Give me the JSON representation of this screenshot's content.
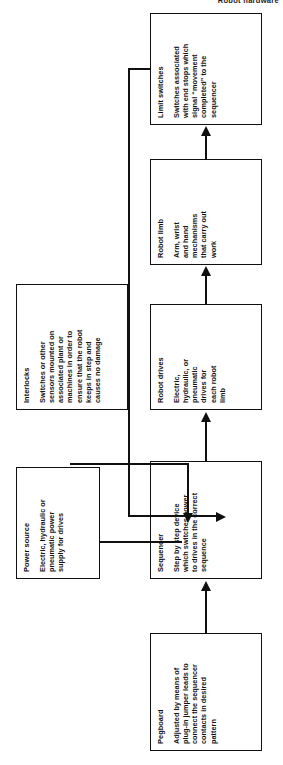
{
  "page": {
    "header": "Robot hardware"
  },
  "diagram": {
    "type": "block-flow-diagram",
    "orientation": "rotated-90-ccw",
    "nodes": [
      {
        "id": "pegboard",
        "title": "Pegboard",
        "body": "Adjusted by means of\nplug-in jumper leads to\nconnect the sequencer\ncontacts in desired\npattern"
      },
      {
        "id": "power-source",
        "title": "Power source",
        "body": "Electric, hydraulic or\npneumatic power\nsupply for drives"
      },
      {
        "id": "sequencer",
        "title": "Sequencer",
        "body": "Step by step device\nwhich switches power\nto drives in the correct\nsequence"
      },
      {
        "id": "interlocks",
        "title": "Interlocks",
        "body": "Switches or other\nsensors mounted on\nassociated plant or\nmachines in order to\nensure that the robot\nkeeps in step and\ncauses no damage"
      },
      {
        "id": "robot-drives",
        "title": "Robot drives",
        "body": "Electric,\nhydraulic, or\npneumatic\ndrives for\neach robot\nlimb"
      },
      {
        "id": "robot-limb",
        "title": "Robot limb",
        "body": "Arm, wrist\nand hand\nmechanisms\nthat carry out\nwork"
      },
      {
        "id": "limit-switches",
        "title": "Limit switches",
        "body": "Switches associated\nwith end stops which\nsignal “movement\ncompleted” to the\nsequencer"
      }
    ],
    "edges": [
      {
        "from": "pegboard",
        "to": "sequencer",
        "style": "arrow"
      },
      {
        "from": "power-source",
        "to": "sequencer",
        "style": "arrow"
      },
      {
        "from": "interlocks",
        "to": "sequencer",
        "style": "arrow"
      },
      {
        "from": "sequencer",
        "to": "robot-drives",
        "style": "arrow"
      },
      {
        "from": "robot-drives",
        "to": "robot-limb",
        "style": "arrow"
      },
      {
        "from": "robot-limb",
        "to": "limit-switches",
        "style": "arrow"
      },
      {
        "from": "limit-switches",
        "to": "sequencer",
        "style": "feedback-arrow"
      }
    ],
    "colors": {
      "ink": "#101010",
      "paper": "#ffffff"
    }
  }
}
